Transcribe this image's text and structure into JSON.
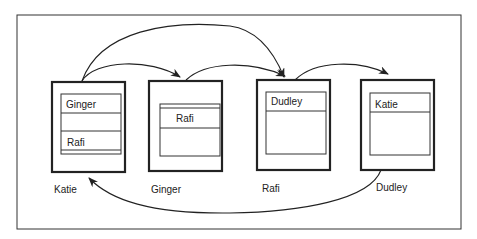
{
  "diagram": {
    "type": "queue-graph",
    "nodes": [
      {
        "id": "katie",
        "label": "Katie",
        "slots": [
          "Ginger",
          "",
          "Rafi"
        ]
      },
      {
        "id": "ginger",
        "label": "Ginger",
        "slots": [
          "Rafi"
        ]
      },
      {
        "id": "rafi",
        "label": "Rafi",
        "slots": [
          "Dudley"
        ]
      },
      {
        "id": "dudley",
        "label": "Dudley",
        "slots": [
          "Katie"
        ]
      }
    ],
    "edges": [
      {
        "from": "katie",
        "to": "ginger"
      },
      {
        "from": "katie",
        "to": "rafi"
      },
      {
        "from": "ginger",
        "to": "rafi"
      },
      {
        "from": "rafi",
        "to": "dudley"
      },
      {
        "from": "dudley",
        "to": "katie"
      }
    ]
  }
}
